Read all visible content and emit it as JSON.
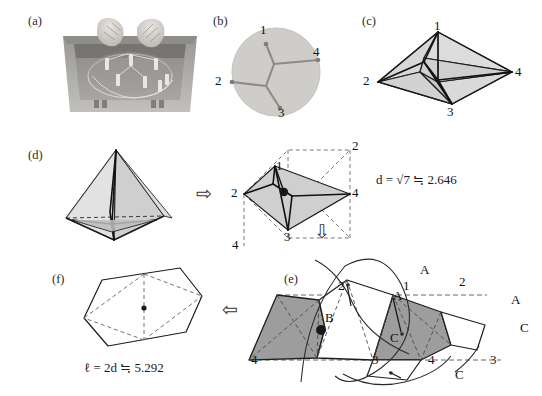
{
  "figure": {
    "caption_tags": [
      "(a)",
      "(b)",
      "(c)",
      "(d)",
      "(e)",
      "(f)"
    ]
  },
  "panels": {
    "a": {
      "tag": "(a)",
      "description": "soap-film experiment photograph: two hands holding acrylic plates with pins inside a plastic box"
    },
    "b": {
      "tag": "(b)",
      "description": "soap film Steiner tree photograph inside circular plate",
      "vertex_labels": [
        "1",
        "2",
        "3",
        "4"
      ]
    },
    "c": {
      "tag": "(c)",
      "description": "rhombus with interior Steiner tree, shaded faces",
      "vertex_labels": [
        "1",
        "2",
        "3",
        "4"
      ]
    },
    "d": {
      "tag": "(d)",
      "description": "regular tetrahedron with interior Steiner tree unfolded to planar rhombus",
      "unfolded_labels": [
        "1",
        "2",
        "3",
        "4",
        "2",
        "4"
      ],
      "formula": "d = √7 ≒ 2.646",
      "formula_parts": {
        "lhs": "d",
        "eq": "=",
        "radical": "√7",
        "approx": "≒",
        "value": "2.646"
      }
    },
    "e": {
      "tag": "(e)",
      "description": "developed surface tiling with shaded pentagonal cells, geodesic curves, and labelled points",
      "numeric_labels": [
        "2",
        "1",
        "2",
        "4",
        "3",
        "4",
        "3"
      ],
      "letter_labels": [
        "A",
        "A",
        "A",
        "B",
        "C",
        "C",
        "C"
      ]
    },
    "f": {
      "tag": "(f)",
      "description": "hexagonal cell with dashed interior rhombus diagonals and centre dot",
      "formula": "ℓ = 2d ≒ 5.292",
      "formula_parts": {
        "lhs": "ℓ",
        "eq": "=",
        "rhs": "2d",
        "approx": "≒",
        "value": "5.292"
      }
    }
  },
  "arrows": {
    "right_arrow": "⇨",
    "down_arrow": "⇩",
    "left_arrow": "⇦"
  },
  "colors": {
    "fill_light": "#d8d8d8",
    "fill_mid": "#c6c6c6",
    "fill_dark": "#9a9a9a",
    "stroke": "#1a1a1a",
    "dashed": "#555555",
    "photo_bg": "#b4b2ae"
  }
}
